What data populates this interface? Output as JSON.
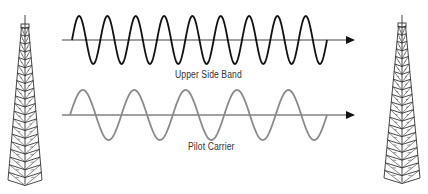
{
  "diagram": {
    "colors": {
      "background": "#ffffff",
      "upper_wave": "#111111",
      "pilot_wave": "#8a8a8a",
      "axis": "#444444",
      "tower": "#333333",
      "label": "#333333"
    },
    "towers": [
      {
        "id": "left",
        "center_x": 25,
        "top_y": 15,
        "box_top_y": 27,
        "base_y": 180,
        "base_half_width": 17
      },
      {
        "id": "right",
        "center_x": 402,
        "top_y": 15,
        "box_top_y": 26,
        "base_y": 178,
        "base_half_width": 18
      }
    ],
    "waves": [
      {
        "id": "upper-side-band",
        "label": "Upper Side Band",
        "axis_y": 40,
        "axis_x_start": 62,
        "axis_x_end": 355,
        "wave_x_start": 72,
        "wave_x_end": 327,
        "cycles": 9,
        "amplitude": 24,
        "label_x": 175,
        "label_y": 69
      },
      {
        "id": "pilot-carrier",
        "label": "Pilot Carrier",
        "axis_y": 115,
        "axis_x_start": 62,
        "axis_x_end": 355,
        "wave_x_start": 70,
        "wave_x_end": 327,
        "cycles": 5,
        "amplitude": 25,
        "label_x": 188,
        "label_y": 141
      }
    ]
  }
}
